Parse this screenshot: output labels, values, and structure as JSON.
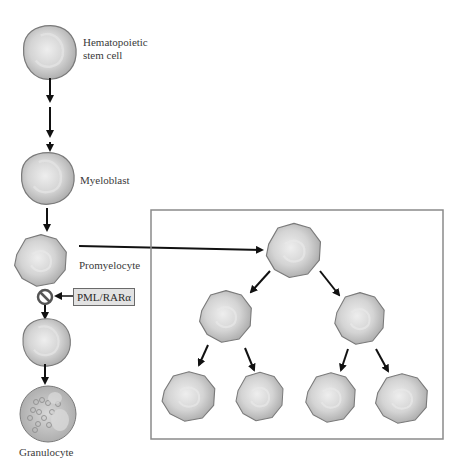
{
  "lineage": [
    {
      "id": "hsc",
      "label_line1": "Hematopoietic",
      "label_line2": "stem cell"
    },
    {
      "id": "myeloblast",
      "label": "Myeloblast"
    },
    {
      "id": "promyelocyte",
      "label": "Promyelocyte"
    },
    {
      "id": "myelocyte",
      "label": ""
    },
    {
      "id": "granulocyte",
      "label": "Granulocyte"
    }
  ],
  "block": {
    "inhibitor_label": "PML/RARα",
    "symbol": "prohibition-symbol"
  },
  "expansion_box": {
    "description": "Promyelocyte proliferation tree",
    "levels": [
      1,
      2,
      4
    ]
  },
  "colors": {
    "cell_fill": "#c8c8c8",
    "cell_outline": "#7a7a7a",
    "arrow": "#111111",
    "box_border": "#8a8a8a",
    "inhibitor_box_fill": "#e2e2e2"
  }
}
